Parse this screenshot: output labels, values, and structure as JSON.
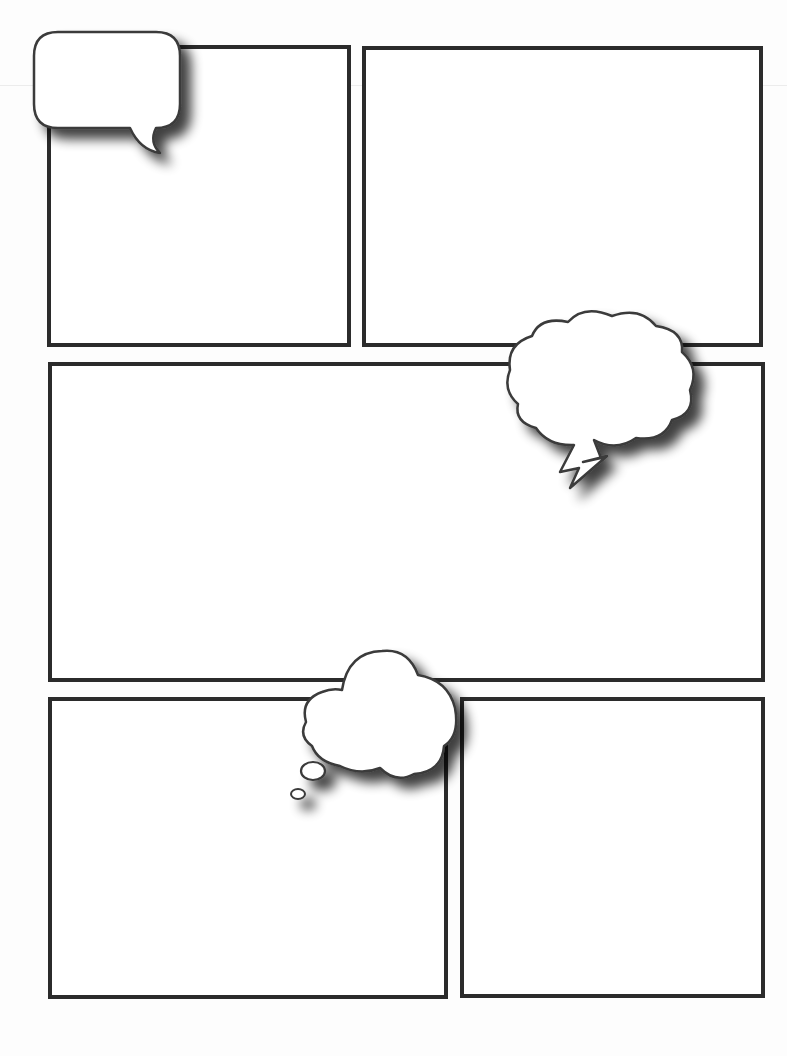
{
  "page": {
    "type": "comic-page-template",
    "background": "#fdfdfd",
    "panel_border_color": "#2b2b2b"
  },
  "panels": [
    {
      "id": 1,
      "x": 47,
      "y": 45,
      "w": 304,
      "h": 302
    },
    {
      "id": 2,
      "x": 362,
      "y": 46,
      "w": 401,
      "h": 301
    },
    {
      "id": 3,
      "x": 48,
      "y": 362,
      "w": 717,
      "h": 320
    },
    {
      "id": 4,
      "x": 48,
      "y": 697,
      "w": 400,
      "h": 302
    },
    {
      "id": 5,
      "x": 460,
      "y": 697,
      "w": 305,
      "h": 301
    }
  ],
  "balloons": [
    {
      "id": "speech",
      "kind": "speech-bubble",
      "text": ""
    },
    {
      "id": "shout",
      "kind": "cloud-bubble-lightning-tail",
      "text": ""
    },
    {
      "id": "thought",
      "kind": "thought-bubble",
      "text": ""
    }
  ]
}
